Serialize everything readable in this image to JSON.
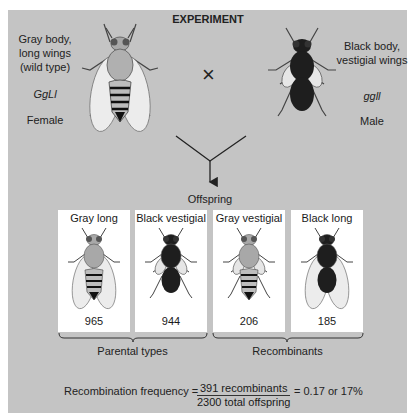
{
  "title": "EXPERIMENT",
  "parents": {
    "female": {
      "phenotype_line1": "Gray body,",
      "phenotype_line2": "long wings",
      "phenotype_line3": "(wild type)",
      "genotype": "GgLl",
      "sex": "Female"
    },
    "male": {
      "phenotype_line1": "Black body,",
      "phenotype_line2": "vestigial wings",
      "genotype": "ggll",
      "sex": "Male"
    },
    "cross_symbol": "×"
  },
  "offspring_label": "Offspring",
  "offspring": [
    {
      "label": "Gray long",
      "count": "965",
      "body": "gray",
      "wings": "long"
    },
    {
      "label": "Black vestigial",
      "count": "944",
      "body": "black",
      "wings": "vestigial"
    },
    {
      "label": "Gray vestigial",
      "count": "206",
      "body": "gray",
      "wings": "vestigial"
    },
    {
      "label": "Black long",
      "count": "185",
      "body": "black",
      "wings": "long"
    }
  ],
  "groups": {
    "parental": "Parental types",
    "recombinant": "Recombinants"
  },
  "formula": {
    "lhs": "Recombination frequency =",
    "numerator": "391 recombinants",
    "denominator": "2300 total offspring",
    "rhs": "= 0.17 or 17%"
  },
  "colors": {
    "panel": "#c4c4c4",
    "gray_body": "#a8a8a8",
    "black_body": "#1e1e1e",
    "wing": "#ececec"
  }
}
